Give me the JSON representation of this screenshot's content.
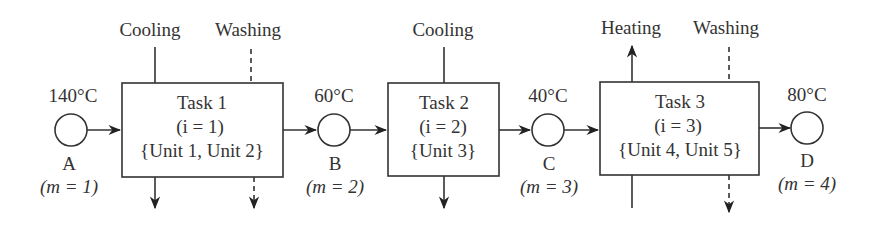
{
  "diagram": {
    "type": "batch process flow",
    "states": [
      {
        "id": "A",
        "label": "A",
        "temperature": "140°C",
        "index": "(m = 1)"
      },
      {
        "id": "B",
        "label": "B",
        "temperature": "60°C",
        "index": "(m = 2)"
      },
      {
        "id": "C",
        "label": "C",
        "temperature": "40°C",
        "index": "(m = 3)"
      },
      {
        "id": "D",
        "label": "D",
        "temperature": "80°C",
        "index": "(m = 4)"
      }
    ],
    "tasks": [
      {
        "title": "Task 1",
        "index": "(i = 1)",
        "units": "{Unit 1, Unit 2}",
        "utility1": "Cooling",
        "utility2": "Washing"
      },
      {
        "title": "Task 2",
        "index": "(i = 2)",
        "units": "{Unit 3}",
        "utility1": "Cooling"
      },
      {
        "title": "Task 3",
        "index": "(i = 3)",
        "units": "{Unit 4, Unit 5}",
        "utility1": "Heating",
        "utility2": "Washing"
      }
    ]
  }
}
